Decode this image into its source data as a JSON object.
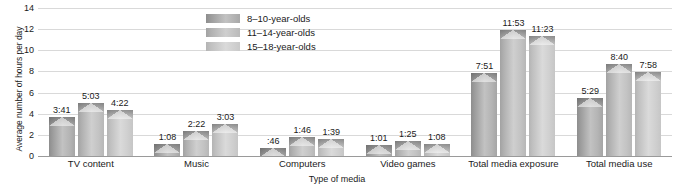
{
  "chart_data": {
    "type": "bar",
    "title": "",
    "xlabel": "Type of media",
    "ylabel": "Average number of hours per day",
    "ylim": [
      0,
      14
    ],
    "yticks": [
      0,
      2,
      4,
      6,
      8,
      10,
      12,
      14
    ],
    "ytick_labels": [
      "0",
      "2",
      "4",
      "6",
      "8",
      "10",
      "12",
      "14"
    ],
    "grid": true,
    "legend_position": "top-center",
    "categories": [
      "TV content",
      "Music",
      "Computers",
      "Video games",
      "Total media exposure",
      "Total media use"
    ],
    "series": [
      {
        "name": "8–10-year-olds",
        "color": "#a8a8a8",
        "labels": [
          "3:41",
          "1:08",
          ":46",
          "1:01",
          "7:51",
          "5:29"
        ],
        "values": [
          3.68,
          1.13,
          0.77,
          1.02,
          7.85,
          5.48
        ]
      },
      {
        "name": "11–14-year-olds",
        "color": "#c2c2c2",
        "labels": [
          "5:03",
          "2:22",
          "1:46",
          "1:25",
          "11:53",
          "8:40"
        ],
        "values": [
          5.05,
          2.37,
          1.77,
          1.42,
          11.88,
          8.67
        ]
      },
      {
        "name": "15–18-year-olds",
        "color": "#d2d2d2",
        "labels": [
          "4:22",
          "3:03",
          "1:39",
          "1:08",
          "11:23",
          "7:58"
        ],
        "values": [
          4.37,
          3.05,
          1.65,
          1.13,
          11.38,
          7.97
        ]
      }
    ]
  }
}
